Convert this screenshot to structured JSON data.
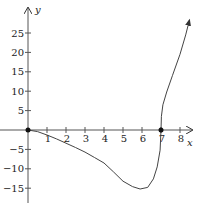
{
  "chart_data": {
    "type": "line",
    "title": "",
    "xlabel": "x",
    "ylabel": "y",
    "xlim": [
      0,
      8.5
    ],
    "ylim": [
      -18,
      29
    ],
    "grid": false,
    "x_ticks": [
      1,
      2,
      3,
      4,
      5,
      6,
      7,
      8
    ],
    "y_ticks": [
      25,
      20,
      15,
      10,
      5,
      -5,
      -10,
      -15
    ],
    "x_tick_labels": [
      "1",
      "2",
      "3",
      "4",
      "5",
      "6",
      "7",
      "8"
    ],
    "y_tick_labels": [
      "25",
      "20",
      "15",
      "10",
      "5",
      "−5",
      "−10",
      "−15"
    ],
    "series": [
      {
        "name": "f(x)",
        "x": [
          0,
          0.5,
          1,
          1.5,
          2,
          2.5,
          3,
          3.5,
          4,
          4.5,
          5,
          5.5,
          5.9,
          6.3,
          6.6,
          6.8,
          6.95,
          7.0,
          7.02,
          7.1,
          7.3,
          7.6,
          8.0,
          8.3,
          8.5
        ],
        "y": [
          0,
          -0.4,
          -1.3,
          -2.3,
          -3.4,
          -4.5,
          -5.7,
          -7.1,
          -8.5,
          -10.8,
          -13.2,
          -14.6,
          -15.2,
          -14.8,
          -12.6,
          -9.5,
          -5.2,
          0,
          3.5,
          6.5,
          9.8,
          14.0,
          19.5,
          24.5,
          28.4
        ]
      }
    ],
    "marked_points": [
      {
        "x": 0,
        "y": 0
      },
      {
        "x": 7,
        "y": 0
      }
    ],
    "arrow_end": {
      "x": 8.5,
      "y": 28.4
    }
  }
}
